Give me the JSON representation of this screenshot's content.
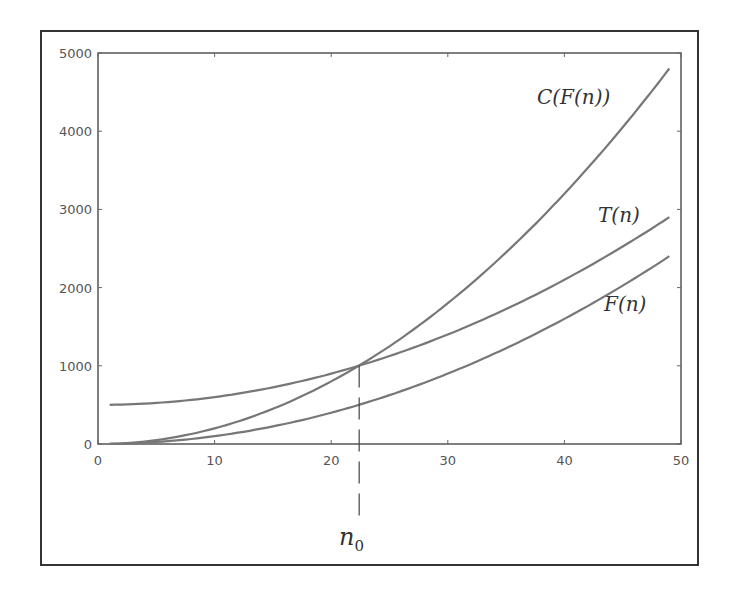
{
  "chart_data": {
    "type": "line",
    "title": "",
    "xlabel": "",
    "ylabel": "",
    "xlim": [
      0,
      50
    ],
    "ylim": [
      0,
      5000
    ],
    "x_ticks": [
      "0",
      "10",
      "20",
      "30",
      "40",
      "50"
    ],
    "y_ticks": [
      "0",
      "1000",
      "2000",
      "3000",
      "4000",
      "5000"
    ],
    "grid": false,
    "legend": "none (inline curve labels)",
    "series": [
      {
        "name": "C(F(n))",
        "x": [
          1,
          5,
          10,
          15,
          20,
          22.5,
          25,
          30,
          35,
          40,
          45,
          49
        ],
        "values": [
          2,
          50,
          200,
          450,
          800,
          1013,
          1250,
          1800,
          2450,
          3200,
          4050,
          4802
        ]
      },
      {
        "name": "T(n)",
        "x": [
          1,
          5,
          10,
          15,
          20,
          22.5,
          25,
          30,
          35,
          40,
          45,
          49
        ],
        "values": [
          501,
          525,
          600,
          725,
          900,
          1006,
          1125,
          1400,
          1725,
          2100,
          2525,
          2901
        ]
      },
      {
        "name": "F(n)",
        "x": [
          1,
          5,
          10,
          15,
          20,
          22.5,
          25,
          30,
          35,
          40,
          45,
          49
        ],
        "values": [
          1,
          25,
          100,
          225,
          400,
          506,
          625,
          900,
          1225,
          1600,
          2025,
          2401
        ]
      }
    ],
    "annotations": [
      {
        "text": "C(F(n))",
        "near": "top-right of C(F(n)) curve"
      },
      {
        "text": "T(n)",
        "near": "end of T(n) curve"
      },
      {
        "text": "F(n)",
        "near": "below end of F(n) curve"
      },
      {
        "text": "n0",
        "x": 22.5,
        "style": "dashed vertical line from crossover point down below axis"
      }
    ]
  },
  "labels": {
    "cfn": "C(F(n))",
    "tn": "T(n)",
    "fn": "F(n)",
    "n0_base": "n",
    "n0_sub": "0"
  }
}
